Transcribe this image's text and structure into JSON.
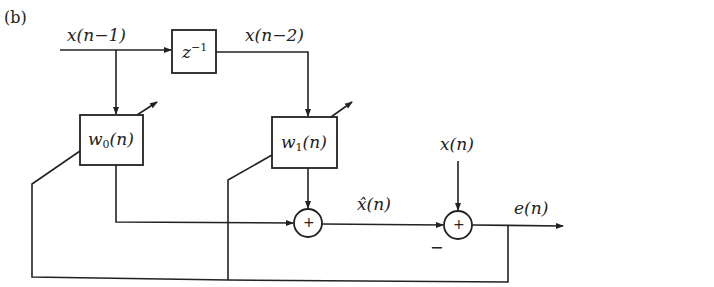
{
  "panel_label": "(b)",
  "signals": {
    "input_delayed_1": "x(n−1)",
    "input_delayed_2": "x(n−2)",
    "desired": "x(n)",
    "estimate": "x̂(n)",
    "error": "e(n)"
  },
  "blocks": {
    "delay": {
      "base": "z",
      "exp": "−1"
    },
    "weight0": {
      "base": "w",
      "sub": "0",
      "arg": "(n)"
    },
    "weight1": {
      "base": "w",
      "sub": "1",
      "arg": "(n)"
    }
  },
  "summers": {
    "sum1": {
      "sign": "+"
    },
    "sum2": {
      "sign": "+",
      "minus_input": "−"
    }
  }
}
